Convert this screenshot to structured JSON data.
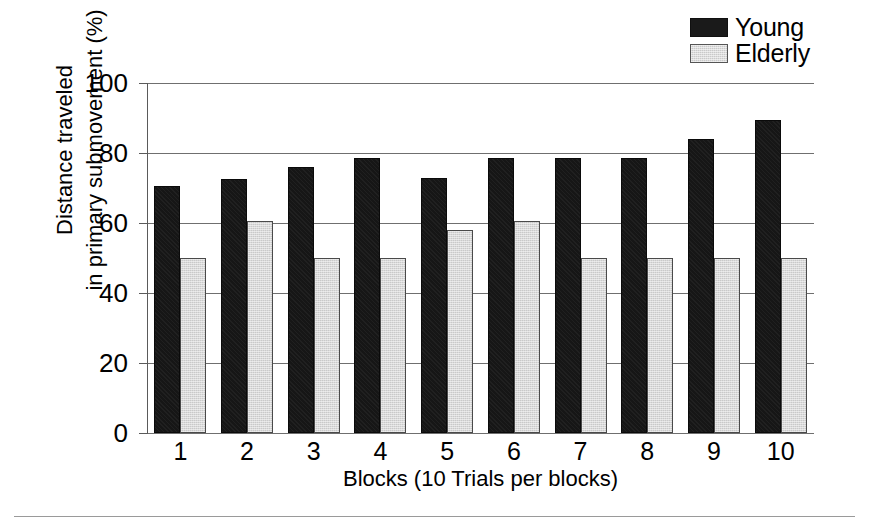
{
  "chart_data": {
    "type": "bar",
    "title": "",
    "subtitle": "",
    "xlabel": "Blocks (10 Trials per blocks)",
    "ylabel": "Distance traveled\nin primary submovement (%)",
    "categories": [
      "1",
      "2",
      "3",
      "4",
      "5",
      "6",
      "7",
      "8",
      "9",
      "10"
    ],
    "series": [
      {
        "name": "Young",
        "color": "#161616",
        "values": [
          70.5,
          72.5,
          76,
          78.5,
          73,
          78.5,
          78.5,
          78.5,
          84,
          89.5
        ]
      },
      {
        "name": "Elderly",
        "color": "#c9c9c9",
        "values": [
          50,
          60.5,
          50,
          50,
          58,
          60.5,
          50,
          50,
          50,
          50
        ]
      }
    ],
    "ylim": [
      0,
      100
    ],
    "yticks": [
      0,
      20,
      40,
      60,
      80,
      100
    ],
    "ytick_labels": [
      "0",
      "20",
      "40",
      "60",
      "80",
      "100"
    ],
    "grid": true,
    "grid_axis": "y",
    "legend_position": "top-right",
    "annotations": []
  },
  "legend": {
    "entries": [
      {
        "label": "Young",
        "swatch": "black-square-swatch"
      },
      {
        "label": "Elderly",
        "swatch": "gray-square-swatch"
      }
    ]
  },
  "axes": {
    "y_title": "Distance traveled\nin primary submovement (%)",
    "x_title": "Blocks (10 Trials per blocks)"
  },
  "colors": {
    "young": "#161616",
    "elderly": "#c9c9c9",
    "gridline": "#6f6f6f",
    "axis": "#5a5a5a",
    "background": "#ffffff",
    "rule": "#9a9a9a"
  }
}
